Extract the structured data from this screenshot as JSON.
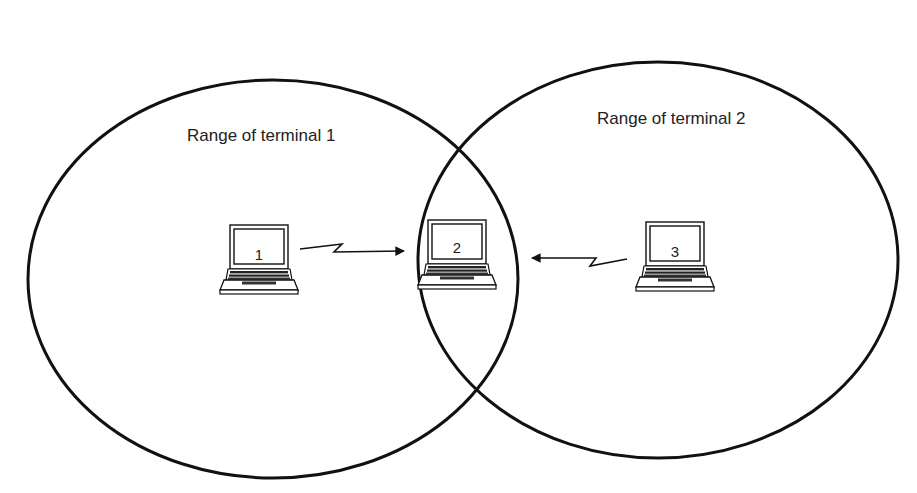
{
  "diagram": {
    "type": "wireless-hidden-terminal",
    "colors": {
      "stroke": "#111111",
      "text": "#222222",
      "background": "#ffffff"
    },
    "ranges": [
      {
        "label": "Range of terminal 1",
        "cx": 273,
        "cy": 279,
        "rx": 245,
        "ry": 199,
        "label_x": 187,
        "label_y": 141
      },
      {
        "label": "Range of terminal 2",
        "cx": 658,
        "cy": 260,
        "rx": 240,
        "ry": 198,
        "label_x": 597,
        "label_y": 124
      }
    ],
    "terminals": [
      {
        "id": "1",
        "icon": "laptop-icon",
        "x": 218,
        "y": 226
      },
      {
        "id": "2",
        "icon": "laptop-icon",
        "x": 417,
        "y": 221
      },
      {
        "id": "3",
        "icon": "laptop-icon",
        "x": 634,
        "y": 223
      }
    ],
    "links": [
      {
        "from": "1",
        "to": "2",
        "style": "lightning-arrow"
      },
      {
        "from": "3",
        "to": "2",
        "style": "lightning-arrow"
      }
    ]
  }
}
